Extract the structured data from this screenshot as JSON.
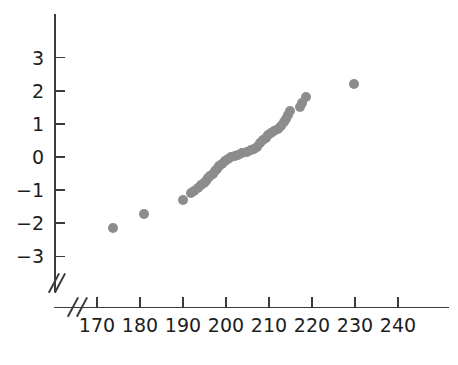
{
  "chart_data": {
    "type": "scatter",
    "title": "",
    "subtitle": "",
    "xlabel": "",
    "ylabel": "",
    "xlim": [
      163,
      246
    ],
    "ylim": [
      -3.45,
      3.55
    ],
    "grid": false,
    "legend": null,
    "axis_break": {
      "x": true,
      "y": true,
      "symbol": "//"
    },
    "x_ticks": [
      170,
      180,
      190,
      200,
      210,
      220,
      230,
      240
    ],
    "y_ticks": [
      3,
      2,
      1,
      0,
      -1,
      -2,
      -3
    ],
    "x_tick_labels": [
      "170",
      "180",
      "190",
      "200",
      "210",
      "220",
      "230",
      "240"
    ],
    "y_tick_labels": [
      "3",
      "2",
      "1",
      "0",
      "−1",
      "−2",
      "−3"
    ],
    "marker": {
      "shape": "circle",
      "color": "#8c8c8c",
      "size": 10
    },
    "series": [
      {
        "name": "normal quantile plot",
        "points": [
          [
            173.8,
            -2.15
          ],
          [
            180.9,
            -1.72
          ],
          [
            189.9,
            -1.31
          ],
          [
            191.8,
            -1.08
          ],
          [
            192.5,
            -1.02
          ],
          [
            193.4,
            -0.95
          ],
          [
            194.2,
            -0.86
          ],
          [
            194.8,
            -0.8
          ],
          [
            195.3,
            -0.72
          ],
          [
            195.8,
            -0.64
          ],
          [
            196.3,
            -0.57
          ],
          [
            196.9,
            -0.5
          ],
          [
            197.4,
            -0.43
          ],
          [
            197.9,
            -0.36
          ],
          [
            198.4,
            -0.28
          ],
          [
            199.0,
            -0.2
          ],
          [
            199.7,
            -0.13
          ],
          [
            200.4,
            -0.07
          ],
          [
            201.2,
            0.0
          ],
          [
            202.1,
            0.04
          ],
          [
            202.9,
            0.07
          ],
          [
            203.8,
            0.11
          ],
          [
            204.8,
            0.16
          ],
          [
            205.7,
            0.2
          ],
          [
            206.5,
            0.24
          ],
          [
            207.3,
            0.31
          ],
          [
            208.0,
            0.41
          ],
          [
            208.6,
            0.5
          ],
          [
            209.2,
            0.58
          ],
          [
            209.8,
            0.65
          ],
          [
            210.4,
            0.72
          ],
          [
            211.2,
            0.79
          ],
          [
            212.0,
            0.86
          ],
          [
            212.8,
            0.95
          ],
          [
            213.4,
            1.06
          ],
          [
            213.9,
            1.16
          ],
          [
            214.4,
            1.27
          ],
          [
            214.9,
            1.38
          ],
          [
            217.2,
            1.52
          ],
          [
            217.6,
            1.63
          ],
          [
            218.6,
            1.8
          ],
          [
            229.7,
            2.22
          ]
        ]
      }
    ]
  },
  "axes": {
    "y_labels": [
      "3",
      "2",
      "1",
      "0",
      "−1",
      "−2",
      "−3"
    ],
    "x_labels": [
      "170",
      "180",
      "190",
      "200",
      "210",
      "220",
      "230",
      "240"
    ]
  }
}
